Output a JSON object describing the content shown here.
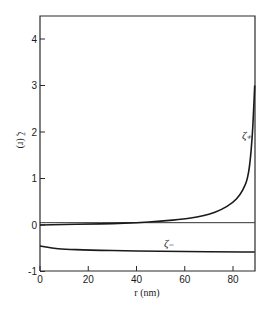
{
  "chart_data": {
    "type": "line",
    "title": "",
    "xlabel": "r (nm)",
    "ylabel": "ζ (r)",
    "xlim": [
      0,
      89
    ],
    "ylim": [
      -1,
      4.5
    ],
    "x_ticks": [
      0,
      20,
      40,
      60,
      80
    ],
    "y_ticks": [
      -1,
      0,
      1,
      2,
      3,
      4
    ],
    "grid": false,
    "legend": "inline labels",
    "series": [
      {
        "name": "ζ+",
        "label": "ζ₊",
        "x": [
          0,
          10,
          20,
          30,
          40,
          50,
          60,
          65,
          70,
          75,
          80,
          83,
          85,
          86,
          87,
          88,
          88.5,
          89
        ],
        "y": [
          0.0,
          0.01,
          0.02,
          0.03,
          0.05,
          0.08,
          0.13,
          0.17,
          0.23,
          0.32,
          0.48,
          0.65,
          0.85,
          1.0,
          1.3,
          1.9,
          2.4,
          3.0
        ]
      },
      {
        "name": "ζ-",
        "label": "ζ₋",
        "x": [
          0,
          5,
          10,
          20,
          40,
          60,
          80,
          89
        ],
        "y": [
          -0.45,
          -0.5,
          -0.52,
          -0.54,
          -0.56,
          -0.57,
          -0.58,
          -0.58
        ]
      },
      {
        "name": "zero line",
        "label": "",
        "x": [
          0,
          89
        ],
        "y": [
          0.05,
          0.05
        ]
      }
    ]
  }
}
